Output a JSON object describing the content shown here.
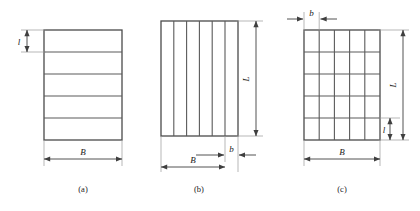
{
  "figure": {
    "background_color": "#ffffff",
    "line_color": "#4a4a4a",
    "thin_line_color": "#8a8a8a",
    "text_color": "#1a1a1a",
    "panels": [
      {
        "id": "a",
        "caption": "(a)",
        "description": "rectangle divided into horizontal strips",
        "strips": 5,
        "orientation": "horizontal",
        "dimensions": [
          {
            "name": "strip-height",
            "label": "l",
            "position": "left",
            "style": "italic"
          },
          {
            "name": "total-width",
            "label": "B",
            "position": "bottom",
            "style": "italic"
          }
        ]
      },
      {
        "id": "b",
        "caption": "(b)",
        "description": "rectangle divided into vertical strips",
        "strips": 6,
        "orientation": "vertical",
        "dimensions": [
          {
            "name": "total-height",
            "label": "L",
            "position": "right",
            "style": "italic"
          },
          {
            "name": "total-width",
            "label": "B",
            "position": "bottom",
            "style": "italic"
          },
          {
            "name": "strip-width",
            "label": "b",
            "position": "bottom-right",
            "style": "italic"
          }
        ]
      },
      {
        "id": "c",
        "caption": "(c)",
        "description": "rectangle divided into a rectangular grid of cells",
        "columns": 5,
        "rows": 5,
        "orientation": "grid",
        "dimensions": [
          {
            "name": "cell-width",
            "label": "b",
            "position": "top",
            "style": "italic"
          },
          {
            "name": "total-height",
            "label": "L",
            "position": "right",
            "style": "italic"
          },
          {
            "name": "cell-height",
            "label": "l",
            "position": "right-lower",
            "style": "italic"
          },
          {
            "name": "total-width",
            "label": "B",
            "position": "bottom",
            "style": "italic"
          }
        ]
      }
    ],
    "footnote": ""
  }
}
